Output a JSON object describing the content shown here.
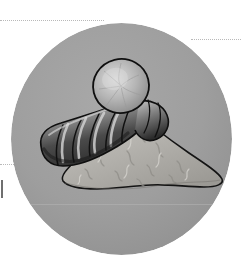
{
  "figure": {
    "name": "ginger-illustration",
    "caption": "Ginger rhizome with a mound of ground ginger powder",
    "shape": "circle",
    "rendering": "grayscale pen-and-ink with wash shading"
  },
  "medallion": {
    "background_color": "#9e9e9e",
    "edge_shadow_color": "#8d8d8d",
    "diameter_px": 221,
    "center": {
      "x": 121,
      "y": 139
    }
  },
  "subjects": [
    {
      "id": "rhizome",
      "label": "Ginger rhizome",
      "description": "Segmented knobbly root with a rounded cut end showing the pale inner flesh",
      "outline_color": "#121212",
      "body_light": "#d6d6d6",
      "body_mid": "#9a9a9a",
      "body_dark": "#3a3a3a",
      "segments": 5
    },
    {
      "id": "powder-mound",
      "label": "Ground ginger powder",
      "description": "Conical heap of loose powder with soft ridges and flecks",
      "outline_color": "#141414",
      "body_light": "#c9c7c2",
      "body_mid": "#a9a7a2",
      "body_dark": "#8b8984"
    }
  ],
  "guides": {
    "color": "#b9b9b9",
    "marker_color": "#6f6f6f",
    "items": [
      {
        "name": "guide-top-left",
        "orientation": "horizontal",
        "x": 0,
        "y": 20,
        "length": 104
      },
      {
        "name": "guide-top-right",
        "orientation": "horizontal",
        "x": 191,
        "y": 39,
        "length": 50
      },
      {
        "name": "guide-mid-left",
        "orientation": "horizontal",
        "x": 0,
        "y": 164,
        "length": 18
      },
      {
        "name": "crop-mark-left",
        "orientation": "vertical",
        "x": 1,
        "y": 180,
        "length": 18
      }
    ],
    "faint_rule": {
      "name": "horizon-rule",
      "x": 26,
      "y": 205,
      "length": 192
    }
  },
  "palette": {
    "page_background": "#ffffff",
    "medallion_gray": "#9e9e9e",
    "ink": "#121212",
    "guide_gray": "#b9b9b9",
    "highlight": "#e4e3e0"
  }
}
